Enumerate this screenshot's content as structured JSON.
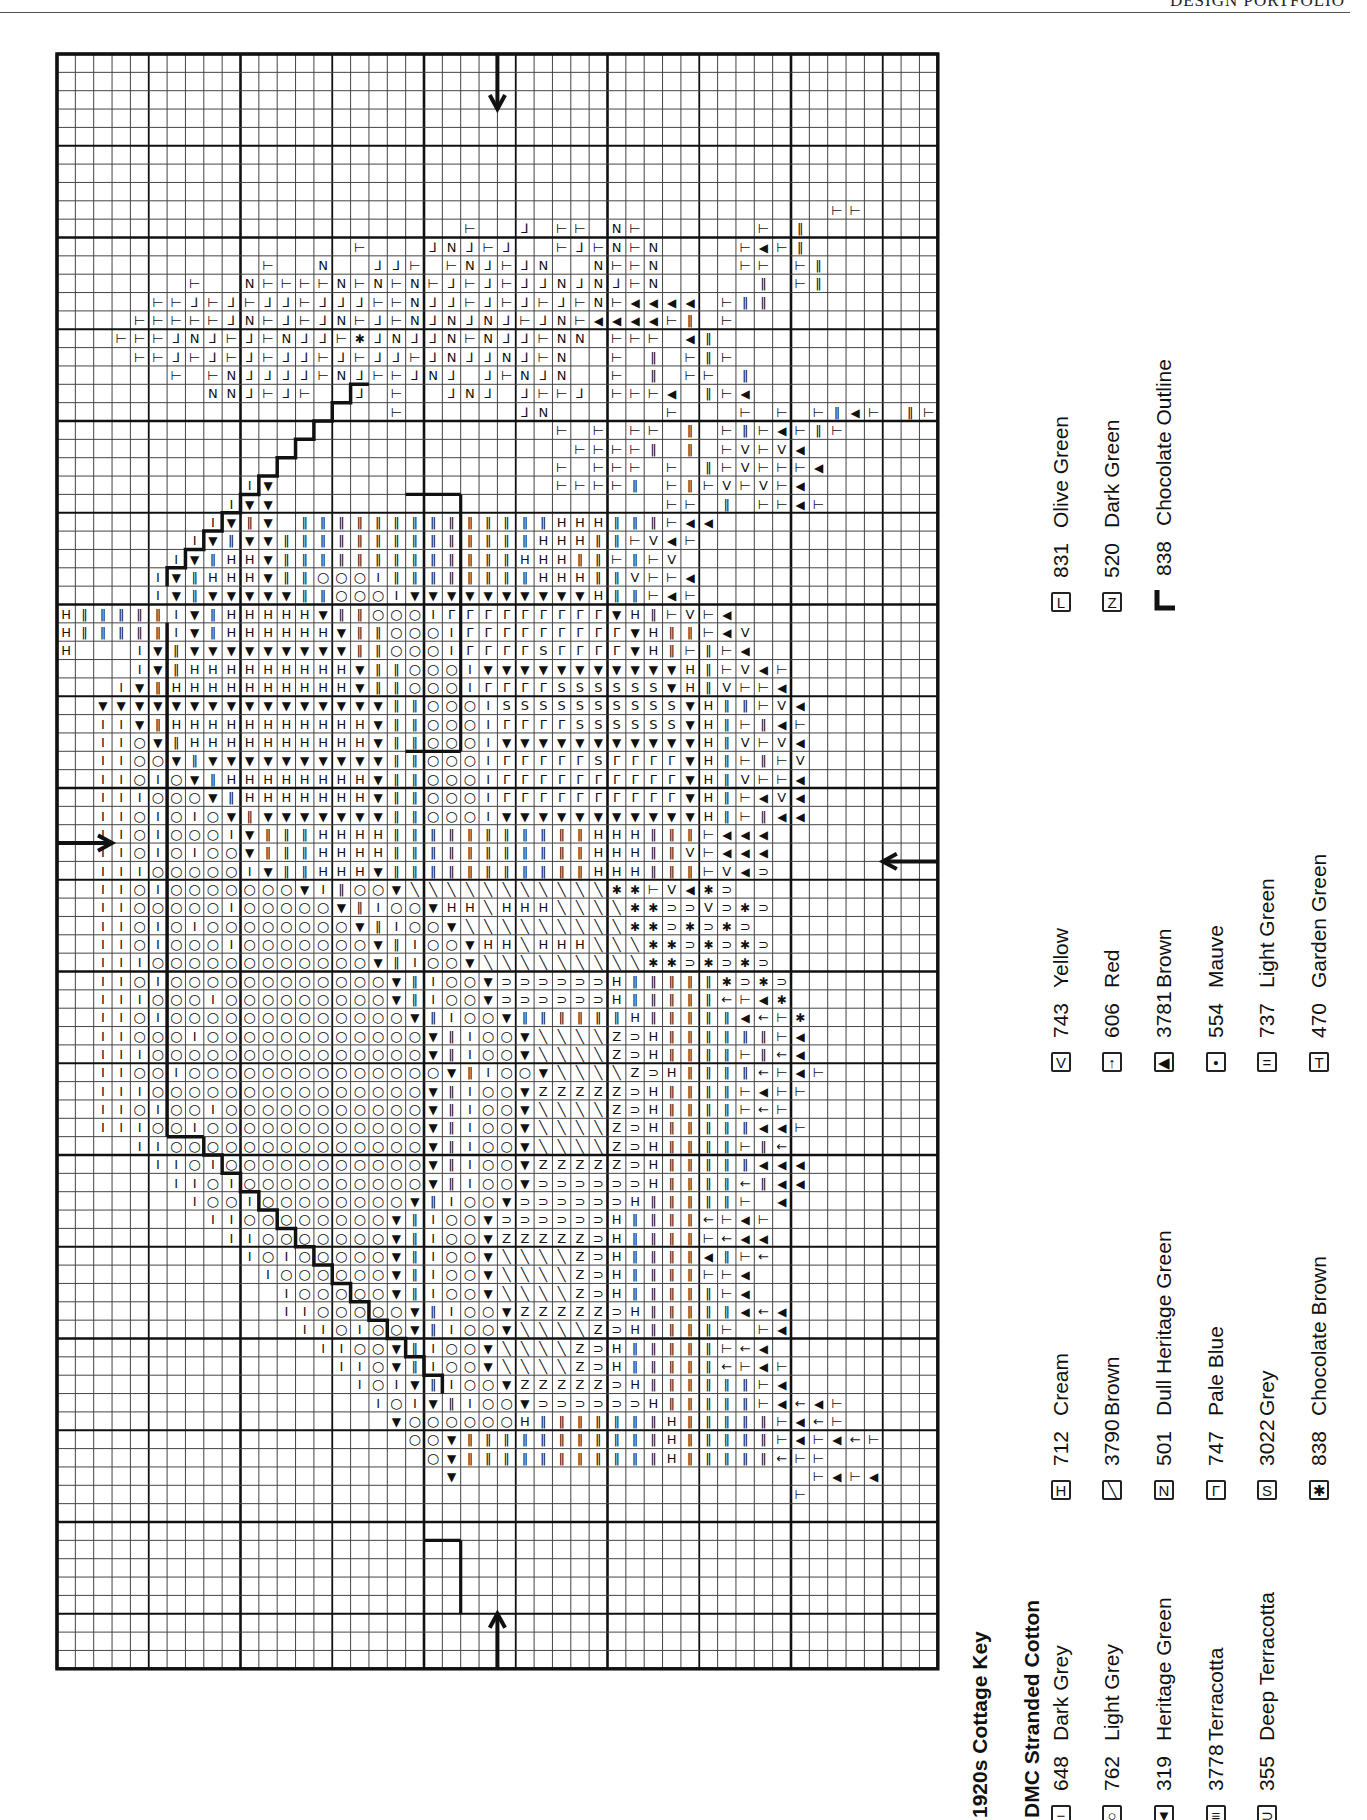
{
  "header": {
    "text": "DESIGN PORTFOLIO"
  },
  "key": {
    "title": "1920s Cottage Key",
    "subtitle": "DMC Stranded Cotton",
    "groups": [
      {
        "entries": [
          {
            "symbol": "−",
            "symbol_name": "dash",
            "code": "648",
            "name": "Dark Grey"
          },
          {
            "symbol": "○",
            "symbol_name": "circle",
            "code": "762",
            "name": "Light Grey"
          },
          {
            "symbol": "▼",
            "symbol_name": "down-triangle",
            "code": "319",
            "name": "Heritage Green"
          },
          {
            "symbol": "≡",
            "symbol_name": "double-bar",
            "code": "3778",
            "name": "Terracotta"
          },
          {
            "symbol": "⊃",
            "symbol_name": "cup",
            "code": "355",
            "name": "Deep Terracotta"
          }
        ]
      },
      {
        "entries": [
          {
            "symbol": "H",
            "symbol_name": "h-bar",
            "code": "712",
            "name": "Cream"
          },
          {
            "symbol": "╲",
            "symbol_name": "slash",
            "code": "3790",
            "name": "Brown"
          },
          {
            "symbol": "N",
            "symbol_name": "n-letter",
            "code": "501",
            "name": "Dull Heritage Green"
          },
          {
            "symbol": "Γ",
            "symbol_name": "corner",
            "code": "747",
            "name": "Pale Blue"
          },
          {
            "symbol": "S",
            "symbol_name": "s-letter",
            "code": "3022",
            "name": "Grey"
          },
          {
            "symbol": "✱",
            "symbol_name": "asterisk",
            "code": "838",
            "name": "Chocolate Brown"
          }
        ]
      },
      {
        "entries": [
          {
            "symbol": "V",
            "symbol_name": "v-letter",
            "code": "743",
            "name": "Yellow"
          },
          {
            "symbol": "↑",
            "symbol_name": "arrow",
            "code": "606",
            "name": "Red"
          },
          {
            "symbol": "◀",
            "symbol_name": "left-triangle",
            "code": "3781",
            "name": "Brown"
          },
          {
            "symbol": "•",
            "symbol_name": "dot",
            "code": "554",
            "name": "Mauve"
          },
          {
            "symbol": "=",
            "symbol_name": "equals",
            "code": "737",
            "name": "Light Green"
          },
          {
            "symbol": "T",
            "symbol_name": "tee",
            "code": "470",
            "name": "Garden Green"
          }
        ]
      },
      {
        "entries": [
          {
            "symbol": "L",
            "symbol_name": "ell",
            "code": "831",
            "name": "Olive Green"
          },
          {
            "symbol": "Z",
            "symbol_name": "zed",
            "code": "520",
            "name": "Dark Green"
          },
          {
            "symbol": "outline",
            "symbol_name": "outline-stroke",
            "code": "838",
            "name": "Chocolate Outline"
          }
        ]
      }
    ]
  },
  "chart_data": {
    "type": "table",
    "grid": {
      "cols": 48,
      "rows": 88,
      "origin_x": 57,
      "origin_y": 54,
      "cell": 18.35,
      "major_every": 10,
      "minor_bold_every": 5
    },
    "center_arrows": [
      {
        "side": "top",
        "col": 24
      },
      {
        "side": "bottom",
        "col": 24
      },
      {
        "side": "left",
        "row": 43
      },
      {
        "side": "right",
        "row": 44
      }
    ],
    "legend": "see key.groups",
    "symbol_codes": {
      "-": "dash",
      "o": "circle",
      "v": "down-triangle",
      "=": "double-bar",
      "U": "cup",
      "H": "h-bar",
      "/": "slash",
      "N": "n-letter",
      "r": "corner",
      "S": "s-letter",
      "*": "asterisk",
      "V": "v-letter",
      "a": "arrow",
      "<": "left-triangle",
      ".": "dot",
      "e": "equals",
      "T": "tee",
      "L": "ell",
      "Z": "zed"
    },
    "rows_start": 4,
    "cells": [
      "................................................",
      "................................................",
      "................................................",
      "................................................",
      "..........................................TT....",
      "......................T..L.TT.NT......T.e.....",
      "................T...LNLTL..TLTNTN....T<Te......",
      "...........T..N..LLT.TNLTLN..NTTN....TT.Te.....",
      ".......T..NTTTTNTNTNTLTLTLLNLNLTN.....e.Te.....",
      ".....TTLTLTLLTLLLTTNLLTLTLTLTNT<<<<.Tee........",
      "....TTTTTLNTLTLNTLTNLNLNLTLNT<<<<Te.T..........",
      "...TTTLNLTLTNLLT*LNLLNTNLLTNN.TTT.<e...........",
      "....TTLTLTLTLLTLTLLTLNLLNLTN..T.e.TeT..........",
      "......T.TNLLLLTNLTTLNL.LTNLN..T.e.TT.e.........",
      "........NNLTLT..L.T..LNL.LTTL.TTT<.eT<.........",
      "..................T......LN......T...T.T.Te<T.eT",
      "...........................T.T.TT.e.TeT<TeT....",
      "............................TTTTe.e.TVTV<......",
      "...........................T.TTT.T.eTVTTT<.....",
      "..........-v...............TTTTe.TeTVTVT<......",
      ".........-vv.....................TT.e.TT<T.....",
      "........-v=v.eeeeeeeeeeeeeeHHHeeeT<<...........",
      ".......-v=vveeeeeeeeeeeeeeHHHeeTV<T............",
      "......-v=HHveeeeeeeeeeeeeHHHeeT=TV.............",
      ".....-v=HHHveeooo-eeeeeeeeHHHeeVTT<............",
      ".....-v=vvvvveeooo-vvvvvvvvvvHeeT<T............",
      "H=====-v=HHHHHveeooo-rrrrrrrrrvHeTVT<..........",
      "H=====-v=HHHHHHveeooo-rrrrrrrrrvHeeT<V.........",
      "H...-v=vvvvvvvvveeooo-rrrrSrrrrvHeTeT<.........",
      "....-v=HHHHHHHHHveeooo-vvvvvvvvvvvHeTV<T.......",
      "...-v=HHHHHHHHHHveeooo-rrrrSSSSSSvHeVTT<.......",
      "..vvvvvvvvvvvvvvvveeooo-SSSSSSSSSSvHeeTV<......",
      "..--v=HHHHHHHHHHHveeooo-rrrrSSSSSSvHeTe<T......",
      "..--ov=HHHHHHHHHHveeooo-vvvvvvvvvvvHeVTV<......",
      "..--oov=vvvvvvvvvveeooo-rrrrrSrrrrvHeTeTV......",
      "..--o-ov=HHHHHHHHveeooo-rrrrrrrrrrvHeVTT<......",
      "..---ooov=HHHHHHHveeooo-rrrrrrrrrrvHeT<V<......",
      "..--o-o-ov=vvvvvvveeooo-vvvvvvvvvvvHeTe<<......",
      "..--o-ooo-vee=HHHHeeeeeeeeeeeHHHeeeT<<<.......",
      "..--o-o-oov=e=HHHHeeeeeeeeeeeHHHeeVT<<<.......",
      "..---ooooo-v=eHHHveeeeeeeeeeeHHHeeeTV<U.......",
      "..--o-ooooooov-eoov///////////**TV<*U.........",
      "..--ooooo-ooooov=-oovHH/HHH////**UUVU*U.......",
      "..--o-o-oooooooov=-oov/////////**U*U*U........",
      "..--o-ooo-ooooooov=-oovHH/HHH///**U*U*U.......",
      "..---oooooooooooov=-oov/////////**U*U*U.......",
      "..--o-oooooooooooov=-oovUUUUUUHeeeee*U*U......",
      "..---ooo-ooooooooov=-oovUUUUUUHeeeeeaT<*......",
      "..--o-coooooooooooov=-oov======Heeeee<aT*.....",
      "..--ooo-oooooooooooov=-oov////ZUHeeeeeeT<.....",
      "..---ooooooooooooooov=-oov////ZUHeeeeTea<.....",
      "..--oo-oooooooooooooov=-oov////ZUHeeeeaT<T....",
      "..---ooooooooooooooov=-oovZZZZZUHeeeeT<TT.....",
      "..--o-oo-ooooooooooov=-oov////ZUHeeeeTaT......",
      "..---oo-oooooooooooov=-oov////ZUHeeeee<<T.....",
      "....--oooooooooooooov=-oov////ZUHeeeeTea......",
      ".....--o-ooooooooooov=-oovZZZZZUHeeeee<<<.....",
      "......--o-oooooooooov=-oovUUUUUUHeeeeae<<.....",
      ".......-oo-oooooooov=-oovUUUUUUHeeeeeT.<......",
      "........--oooooooov=-oovUUUUUUHeeeeaT<T.......",
      ".........--ooooooov=-oovZZZZZUHeeeeTa<<.......",
      "..........-o-ooooov=-oov////ZUHeeee<eTa.......",
      "...........-oooooov=-oov////ZUHeeeeTT<........",
      "............-ooooov=-oov////ZUHeeeeeT<........",
      "............--ooooov=-oovZZZZZUHeeeee<a<......",
      ".............--o-oov=-oov////ZUHeeeeT.T<......",
      "..............--oov=-oov////ZUHeeeeeTa<.......",
      "...............--ov=-oov////ZUHeeeeeaT<T......",
      "................-o-v=-oovZZZZZUHeeeeeeT<......",
      ".................-o-v=-oovUUUUUUHeeeeeT<a<T...",
      "..................vooooooHeeeeeeeHeeeeeT<aT...",
      "...................oov===========HeeeeeT<T<aT.",
      "....................ov===========HeeeeeaTT....",
      ".....................v...................T<T<..",
      "........................................T......"
    ]
  }
}
